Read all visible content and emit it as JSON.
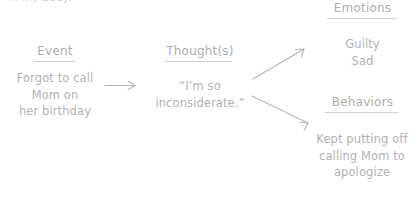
{
  "canvas": {
    "width": 419,
    "height": 204,
    "background": "#ffffff",
    "text_color": "#b4b2b2",
    "rule_color": "#d2d0d0"
  },
  "clipped_top_text": "in my body.",
  "columns": {
    "event": {
      "header": "Event",
      "body": "Forgot to call\nMom on\nher birthday"
    },
    "thoughts": {
      "header": "Thought(s)",
      "body": "“I’m so\ninconsiderate.”"
    },
    "emotions": {
      "header": "Emotions",
      "body": "Guilty\nSad"
    },
    "behaviors": {
      "header": "Behaviors",
      "body": "Kept putting off\ncalling Mom to\napologize"
    }
  },
  "arrows": [
    {
      "name": "event-to-thought-arrow",
      "direction": "right"
    },
    {
      "name": "thought-to-emotions-arrow",
      "direction": "up-right"
    },
    {
      "name": "thought-to-behaviors-arrow",
      "direction": "down-right"
    }
  ]
}
